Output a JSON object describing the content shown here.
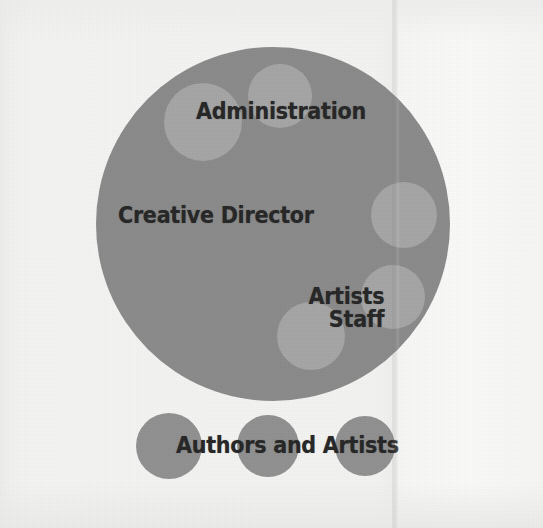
{
  "figure": {
    "type": "venn-style organization diagram",
    "background_color": "#f4f4f2",
    "main_circle_color": "#8a8a8a",
    "inner_circle_color": "#a7a7a7",
    "bottom_circle_color": "#909090",
    "text_color": "#262626"
  },
  "labels": {
    "administration": "Administration",
    "creative_director": "Creative Director",
    "artists": "Artists",
    "staff": "Staff",
    "authors_and_artists": "Authors and Artists"
  },
  "shapes": {
    "main_circle": {
      "cx": 273,
      "cy": 224,
      "r": 177
    },
    "inner_circles": [
      {
        "name": "administration-left-circle",
        "cx": 203,
        "cy": 122,
        "r": 39
      },
      {
        "name": "administration-right-circle",
        "cx": 280,
        "cy": 96,
        "r": 32
      },
      {
        "name": "right-upper-circle",
        "cx": 404,
        "cy": 215,
        "r": 33
      },
      {
        "name": "right-lower-circle",
        "cx": 393,
        "cy": 297,
        "r": 32
      },
      {
        "name": "staff-circle",
        "cx": 311,
        "cy": 336,
        "r": 34
      }
    ],
    "bottom_circles": [
      {
        "name": "authors-circle-1",
        "cx": 169,
        "cy": 446,
        "r": 33
      },
      {
        "name": "authors-circle-2",
        "cx": 268,
        "cy": 446,
        "r": 31
      },
      {
        "name": "authors-circle-3",
        "cx": 365,
        "cy": 446,
        "r": 30
      }
    ]
  }
}
